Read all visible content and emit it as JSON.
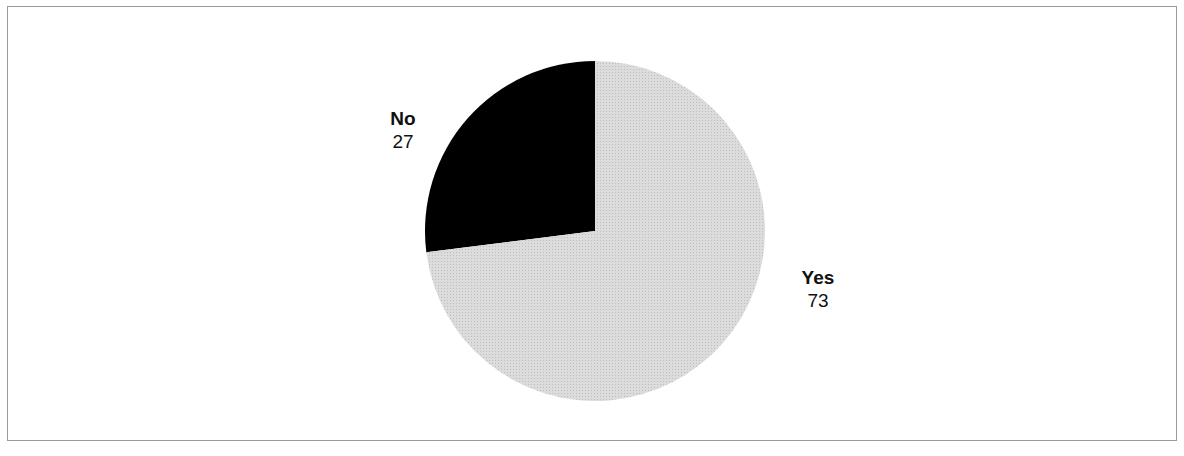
{
  "chart_data": {
    "type": "pie",
    "title": "",
    "categories": [
      "No",
      "Yes"
    ],
    "values": [
      27,
      73
    ],
    "colors": [
      "#000000",
      "#d6d6d6"
    ],
    "start_angle": "12 o'clock",
    "legend": "none (direct labels)",
    "labels": [
      {
        "name": "No",
        "value": "27"
      },
      {
        "name": "Yes",
        "value": "73"
      }
    ]
  }
}
